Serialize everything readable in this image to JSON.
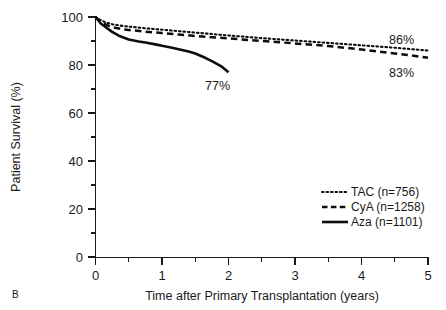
{
  "chart_data": {
    "type": "line",
    "title": "",
    "subtitle": "",
    "panel_label": "B",
    "xlabel": "Time after Primary Transplantation (years)",
    "ylabel": "Patient Survival (%)",
    "xlim": [
      0,
      5
    ],
    "ylim": [
      0,
      100
    ],
    "grid": false,
    "legend_position": "lower-right",
    "xticks": [
      0,
      1,
      2,
      3,
      4,
      5
    ],
    "xtick_labels": [
      "0",
      "1",
      "2",
      "3",
      "4",
      "5"
    ],
    "xminor_ticks": [
      0.5,
      1.5,
      2.5,
      3.5,
      4.5
    ],
    "yticks": [
      0,
      20,
      40,
      60,
      80,
      100
    ],
    "ytick_labels": [
      "0",
      "20",
      "40",
      "60",
      "80",
      "100"
    ],
    "yminor_ticks": [
      10,
      30,
      50,
      70,
      90
    ],
    "series": [
      {
        "name": "TAC (n=756)",
        "short_name": "TAC",
        "n": 756,
        "style": "dotted",
        "color": "#0d0d0d",
        "end_label": "86%",
        "x": [
          0,
          0.08,
          0.17,
          0.25,
          0.4,
          0.5,
          0.75,
          1.0,
          1.25,
          1.5,
          1.75,
          2.0,
          2.5,
          3.0,
          3.5,
          4.0,
          4.25,
          4.5,
          4.75,
          5.0
        ],
        "y": [
          100,
          98.6,
          97.6,
          97.0,
          96.3,
          96.0,
          95.3,
          94.7,
          94.1,
          93.5,
          92.9,
          92.3,
          91.2,
          90.2,
          89.2,
          88.2,
          87.7,
          87.2,
          86.6,
          86.0
        ]
      },
      {
        "name": "CyA (n=1258)",
        "short_name": "CyA",
        "n": 1258,
        "style": "dashed",
        "color": "#0d0d0d",
        "end_label": "83%",
        "x": [
          0,
          0.08,
          0.17,
          0.25,
          0.4,
          0.5,
          0.75,
          1.0,
          1.25,
          1.5,
          1.75,
          2.0,
          2.5,
          3.0,
          3.5,
          4.0,
          4.25,
          4.5,
          4.75,
          5.0
        ],
        "y": [
          100,
          98.0,
          96.6,
          95.8,
          94.9,
          94.6,
          93.9,
          93.3,
          92.7,
          92.1,
          91.6,
          91.1,
          90.0,
          89.0,
          87.9,
          86.5,
          85.6,
          84.8,
          84.0,
          83.0
        ]
      },
      {
        "name": "Aza (n=1101)",
        "short_name": "Aza",
        "n": 1101,
        "style": "solid",
        "color": "#0d0d0d",
        "end_label": "77%",
        "x": [
          0,
          0.08,
          0.17,
          0.25,
          0.35,
          0.5,
          0.65,
          0.75,
          0.9,
          1.0,
          1.15,
          1.25,
          1.4,
          1.5,
          1.65,
          1.75,
          1.9,
          2.0
        ],
        "y": [
          100,
          97.3,
          95.4,
          93.8,
          92.2,
          90.6,
          89.8,
          89.4,
          88.6,
          88.0,
          87.2,
          86.6,
          85.6,
          84.8,
          83.0,
          81.6,
          79.3,
          77.0
        ]
      }
    ],
    "annotations": [
      {
        "text": "86%",
        "series": "TAC",
        "x": 5,
        "y": 86
      },
      {
        "text": "83%",
        "series": "CyA",
        "x": 5,
        "y": 83
      },
      {
        "text": "77%",
        "series": "Aza",
        "x": 2,
        "y": 77
      }
    ]
  },
  "legend": {
    "entries": [
      {
        "label": "TAC (n=756)",
        "style": "dotted"
      },
      {
        "label": "CyA (n=1258)",
        "style": "dashed"
      },
      {
        "label": "Aza (n=1101)",
        "style": "solid"
      }
    ]
  },
  "colors": {
    "background": "#ffffff",
    "foreground": "#1a1a1a",
    "line": "#0d0d0d"
  }
}
